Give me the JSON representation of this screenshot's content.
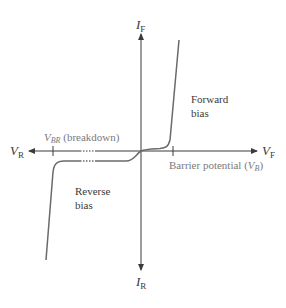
{
  "diagram": {
    "axes": {
      "vertical_top": {
        "main": "I",
        "sub": "F"
      },
      "vertical_bottom": {
        "main": "I",
        "sub": "R"
      },
      "horizontal_left": {
        "main": "V",
        "sub": "R"
      },
      "horizontal_right": {
        "main": "V",
        "sub": "F"
      }
    },
    "labels": {
      "forward_line1": "Forward",
      "forward_line2": "bias",
      "reverse_line1": "Reverse",
      "reverse_line2": "bias",
      "breakdown_var": "V",
      "breakdown_sub": "BR",
      "breakdown_text": " (breakdown)",
      "barrier_text": "Barrier potential (",
      "barrier_var": "V",
      "barrier_sub": "B",
      "barrier_close": ")"
    },
    "colors": {
      "axis": "#3a3a3a",
      "curve": "#6a6a6a",
      "text": "#3a3a3a",
      "muted_text": "#7a7a7a"
    }
  }
}
